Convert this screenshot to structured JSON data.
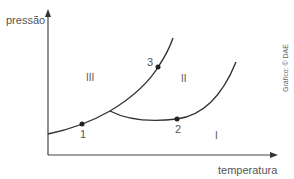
{
  "diagram": {
    "type": "phase-diagram",
    "y_axis_label": "pressão",
    "x_axis_label": "temperatura",
    "regions": [
      {
        "id": "III",
        "label": "III"
      },
      {
        "id": "II",
        "label": "II"
      },
      {
        "id": "I",
        "label": "I"
      }
    ],
    "points": [
      {
        "id": "1",
        "label": "1"
      },
      {
        "id": "2",
        "label": "2"
      },
      {
        "id": "3",
        "label": "3"
      }
    ],
    "credit": "Gráfico: © DAE",
    "line_color": "#333333"
  }
}
